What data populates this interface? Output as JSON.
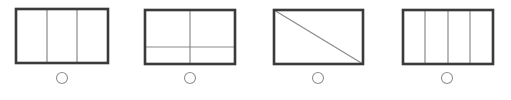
{
  "colors": {
    "frame": "#3a3a3a",
    "divider": "#8a8a8a",
    "circle": "#8f8f8f",
    "background": "#ffffff"
  },
  "figures": [
    {
      "id": "figure-1",
      "description": "rectangle divided into 3 vertical parts",
      "rect": {
        "x": 16,
        "y": 9,
        "w": 92,
        "h": 54
      },
      "lines": [
        {
          "x1": 47,
          "y1": 9,
          "x2": 47,
          "y2": 63
        },
        {
          "x1": 77,
          "y1": 9,
          "x2": 77,
          "y2": 63
        }
      ],
      "answer_circle": {
        "cx": 62,
        "cy": 78,
        "r": 5.5
      }
    },
    {
      "id": "figure-2",
      "description": "rectangle divided by one vertical and one horizontal line into 4 unequal parts",
      "rect": {
        "x": 145,
        "y": 10,
        "w": 90,
        "h": 54
      },
      "lines": [
        {
          "x1": 190,
          "y1": 10,
          "x2": 190,
          "y2": 64
        },
        {
          "x1": 145,
          "y1": 47,
          "x2": 235,
          "y2": 47
        }
      ],
      "answer_circle": {
        "cx": 190,
        "cy": 78,
        "r": 5.5
      }
    },
    {
      "id": "figure-3",
      "description": "rectangle divided by a diagonal into 2 triangles",
      "rect": {
        "x": 274,
        "y": 10,
        "w": 89,
        "h": 54
      },
      "lines": [
        {
          "x1": 274,
          "y1": 10,
          "x2": 363,
          "y2": 64
        }
      ],
      "answer_circle": {
        "cx": 318,
        "cy": 78,
        "r": 5.5
      }
    },
    {
      "id": "figure-4",
      "description": "rectangle divided into 4 vertical parts",
      "rect": {
        "x": 403,
        "y": 10,
        "w": 90,
        "h": 54
      },
      "lines": [
        {
          "x1": 425,
          "y1": 10,
          "x2": 425,
          "y2": 64
        },
        {
          "x1": 448,
          "y1": 10,
          "x2": 448,
          "y2": 64
        },
        {
          "x1": 470,
          "y1": 10,
          "x2": 470,
          "y2": 64
        }
      ],
      "answer_circle": {
        "cx": 447,
        "cy": 78,
        "r": 5.5
      }
    }
  ]
}
